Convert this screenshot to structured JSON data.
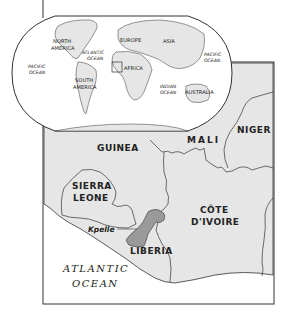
{
  "figure": {
    "colors": {
      "land": "#e6e6e6",
      "ocean": "#ffffff",
      "highlight_region": "#9a9a9a",
      "border": "#333333",
      "text": "#222222"
    }
  },
  "world_inset": {
    "continents": [
      {
        "name": "NORTH AMERICA",
        "line1": "NORTH",
        "line2": "AMERICA"
      },
      {
        "name": "SOUTH AMERICA",
        "line1": "SOUTH",
        "line2": "AMERICA"
      },
      {
        "name": "EUROPE",
        "line1": "EUROPE"
      },
      {
        "name": "ASIA",
        "line1": "ASIA"
      },
      {
        "name": "AFRICA",
        "line1": "AFRICA"
      },
      {
        "name": "AUSTRALIA",
        "line1": "AUSTRALIA"
      }
    ],
    "oceans": [
      {
        "name": "PACIFIC OCEAN (west)",
        "line1": "PACIFIC",
        "line2": "OCEAN"
      },
      {
        "name": "ATLANTIC OCEAN",
        "line1": "ATLANTIC",
        "line2": "OCEAN"
      },
      {
        "name": "INDIAN OCEAN",
        "line1": "INDIAN",
        "line2": "OCEAN"
      },
      {
        "name": "PACIFIC OCEAN (east)",
        "line1": "PACIFIC",
        "line2": "OCEAN"
      }
    ],
    "locator_box": "West Africa"
  },
  "regional_map": {
    "countries": [
      {
        "name": "GUINEA",
        "line1": "GUINEA"
      },
      {
        "name": "MALI",
        "line1": "MALI"
      },
      {
        "name": "NIGER",
        "line1": "NIGER"
      },
      {
        "name": "SIERRA LEONE",
        "line1": "SIERRA",
        "line2": "LEONE"
      },
      {
        "name": "CÔTE D'IVOIRE",
        "line1": "CÔTE",
        "line2": "D'IVOIRE"
      },
      {
        "name": "LIBERIA",
        "line1": "LIBERIA"
      }
    ],
    "ocean": {
      "line1": "ATLANTIC",
      "line2": "OCEAN"
    },
    "highlighted_people": "Kpelle"
  }
}
